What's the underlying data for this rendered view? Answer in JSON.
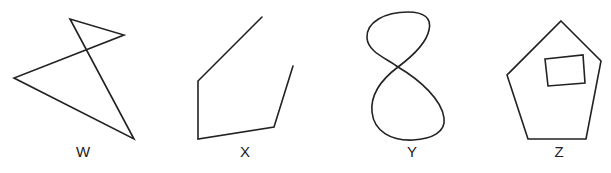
{
  "figures": [
    {
      "label": "W",
      "description": "self-intersecting closed quadrilateral (bowtie-like)",
      "points": [
        [
          70,
          19
        ],
        [
          134,
          139
        ],
        [
          14,
          78
        ],
        [
          124,
          35
        ]
      ],
      "closed": true,
      "label_pos": [
        83,
        157
      ]
    },
    {
      "label": "X",
      "description": "open polyline with five vertices",
      "points": [
        [
          262,
          17
        ],
        [
          198,
          81
        ],
        [
          198,
          139
        ],
        [
          274,
          127
        ],
        [
          293,
          66
        ]
      ],
      "closed": false,
      "label_pos": [
        245,
        157
      ]
    },
    {
      "label": "Y",
      "description": "figure-eight closed curve",
      "label_pos": [
        412,
        157
      ]
    },
    {
      "label": "Z",
      "description": "pentagon with a quadrilateral hole inside",
      "points": [
        [
          561,
          21
        ],
        [
          601,
          61
        ],
        [
          586,
          139
        ],
        [
          528,
          139
        ],
        [
          507,
          75
        ]
      ],
      "inner": [
        [
          545,
          59
        ],
        [
          583,
          55
        ],
        [
          585,
          83
        ],
        [
          548,
          86
        ]
      ],
      "closed": true,
      "label_pos": [
        559,
        157
      ]
    }
  ],
  "colors": {
    "stroke": "#222222",
    "background": "#ffffff"
  }
}
